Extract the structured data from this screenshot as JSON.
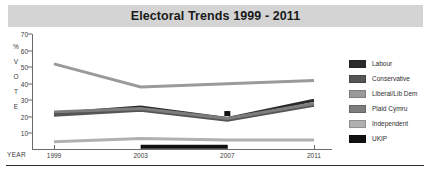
{
  "header": {
    "title": "Electoral Trends 1999 - 2011",
    "band_color": "#d4d4d4"
  },
  "axis": {
    "vertical_letters": [
      "%",
      "V",
      "O",
      "T",
      "E"
    ],
    "year_label": "YEAR"
  },
  "legend": {
    "position": "right",
    "items": [
      {
        "label": "Labour",
        "color": "#2b2b2b"
      },
      {
        "label": "Conservative",
        "color": "#555555"
      },
      {
        "label": "Liberal/Lib Dem",
        "color": "#9a9a9a"
      },
      {
        "label": "Plaid Cymru",
        "color": "#7d7d7d"
      },
      {
        "label": "Independent",
        "color": "#b0b0b0"
      },
      {
        "label": "UKIP",
        "color": "#111111"
      }
    ]
  },
  "chart_data": {
    "type": "line",
    "title": "Electoral Trends 1999 - 2011",
    "xlabel": "YEAR",
    "ylabel": "% VOTE",
    "x": [
      "1999",
      "2003",
      "2007",
      "2011"
    ],
    "categories": [
      "1999",
      "2003",
      "2007",
      "2011"
    ],
    "yticks": [
      10,
      20,
      30,
      40,
      50,
      60,
      70
    ],
    "ylim": [
      0,
      70
    ],
    "grid": false,
    "legend_position": "right",
    "series": [
      {
        "name": "Labour",
        "color": "#2b2b2b",
        "values": [
          22,
          26,
          19,
          30
        ]
      },
      {
        "name": "Conservative",
        "color": "#555555",
        "values": [
          21,
          24,
          18,
          27
        ]
      },
      {
        "name": "Liberal/Lib Dem",
        "color": "#9a9a9a",
        "values": [
          52,
          38,
          40,
          42
        ]
      },
      {
        "name": "Plaid Cymru",
        "color": "#7d7d7d",
        "values": [
          23,
          25,
          19,
          28
        ]
      },
      {
        "name": "Independent",
        "color": "#b0b0b0",
        "values": [
          5,
          7,
          6,
          6
        ]
      },
      {
        "name": "UKIP",
        "color": "#111111",
        "values": [
          null,
          2,
          2,
          null
        ]
      }
    ],
    "markers": [
      {
        "series": "UKIP",
        "x": "2007",
        "y": 22
      }
    ]
  }
}
